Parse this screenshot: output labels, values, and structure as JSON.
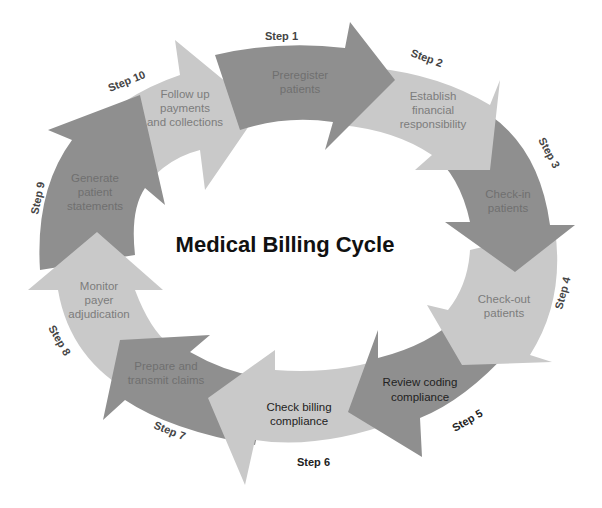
{
  "title": "Medical Billing Cycle",
  "colors": {
    "dark": "#8f8f8f",
    "light": "#c9c9c9",
    "text_on_dark": "#6f6f6f",
    "text_on_light": "#7c7c7c",
    "text_black": "#222222",
    "step_label": "#444444"
  },
  "steps": [
    {
      "step": "Step 1",
      "lines": [
        "Preregister",
        "patients"
      ]
    },
    {
      "step": "Step 2",
      "lines": [
        "Establish",
        "financial",
        "responsibility"
      ]
    },
    {
      "step": "Step 3",
      "lines": [
        "Check-in",
        "patients"
      ]
    },
    {
      "step": "Step 4",
      "lines": [
        "Check-out",
        "patients"
      ]
    },
    {
      "step": "Step 5",
      "lines": [
        "Review coding",
        "compliance"
      ]
    },
    {
      "step": "Step 6",
      "lines": [
        "Check billing",
        "compliance"
      ]
    },
    {
      "step": "Step 7",
      "lines": [
        "Prepare and",
        "transmit claims"
      ]
    },
    {
      "step": "Step 8",
      "lines": [
        "Monitor",
        "payer",
        "adjudication"
      ]
    },
    {
      "step": "Step 9",
      "lines": [
        "Generate",
        "patient",
        "statements"
      ]
    },
    {
      "step": "Step 10",
      "lines": [
        "Follow up",
        "payments",
        "and collections"
      ]
    }
  ]
}
